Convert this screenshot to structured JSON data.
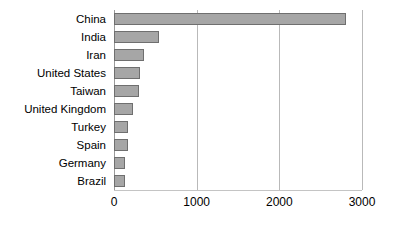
{
  "chart_data": {
    "type": "bar",
    "orientation": "horizontal",
    "title": "",
    "subtitle": "",
    "xlabel": "",
    "ylabel": "",
    "categories": [
      "China",
      "India",
      "Iran",
      "United States",
      "Taiwan",
      "United Kingdom",
      "Turkey",
      "Spain",
      "Germany",
      "Brazil"
    ],
    "values": [
      2805,
      550,
      360,
      320,
      300,
      230,
      175,
      165,
      135,
      135
    ],
    "xlim": [
      0,
      3000
    ],
    "xticks": [
      0,
      1000,
      2000,
      3000
    ],
    "xtick_labels": [
      "0",
      "1000",
      "2000",
      "3000"
    ],
    "grid": "vertical-major",
    "legend": "none",
    "bar_fill_color": "#a6a6a6",
    "bar_border_color": "#6f6f6f",
    "gridline_color": "#b9b9b9",
    "axis_color": "#9a9a9a",
    "background_color": "#ffffff"
  }
}
